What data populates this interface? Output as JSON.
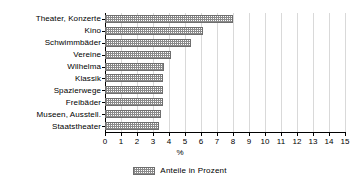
{
  "chart_data": {
    "type": "bar",
    "orientation": "horizontal",
    "title": "",
    "subtitle": "",
    "xlabel": "%",
    "ylabel": "",
    "xlim": [
      0,
      15
    ],
    "xticks": [
      0,
      1,
      2,
      3,
      4,
      5,
      6,
      7,
      8,
      9,
      10,
      11,
      12,
      13,
      14,
      15
    ],
    "xtick_labels": [
      "0",
      "1",
      "2",
      "3",
      "4",
      "5",
      "6",
      "7",
      "8",
      "9",
      "10",
      "11",
      "12",
      "13",
      "14",
      "15"
    ],
    "grid": true,
    "grid_axis": "x",
    "legend_position": "bottom-center",
    "legend": [
      "Anteile in Prozent"
    ],
    "categories": [
      "Theater, Konzerte",
      "Kino",
      "Schwimmbäder",
      "Vereine",
      "Wilhelma",
      "Klassik",
      "Spazierwege",
      "Freibäder",
      "Museen, Ausstell.",
      "Staatstheater"
    ],
    "series": [
      {
        "name": "Anteile in Prozent",
        "values": [
          8.0,
          6.1,
          5.4,
          4.1,
          3.7,
          3.6,
          3.6,
          3.6,
          3.5,
          3.4
        ]
      }
    ]
  },
  "colors": {
    "axis": "#000000",
    "grid": "#d9d9d9",
    "bar_border": "#6e6e6e",
    "bar_hatch": "#8a8a8a",
    "background": "#ffffff",
    "text": "#000000"
  }
}
